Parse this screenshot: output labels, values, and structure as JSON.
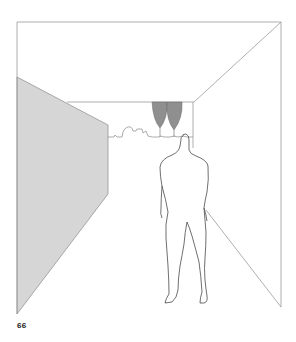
{
  "page": {
    "number": "66"
  },
  "illustration": {
    "subject": "perspective-room-with-standing-figure",
    "colors": {
      "background": "#ffffff",
      "line": "#8a8a8a",
      "figure_line": "#4a4a4a",
      "left_wall_fill": "#d6d6d6",
      "lamp_fill": "#8f8f8f"
    }
  }
}
